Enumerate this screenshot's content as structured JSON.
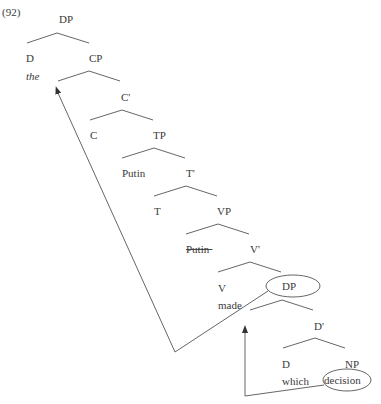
{
  "example_number": "(92)",
  "colors": {
    "line": "#555555",
    "text": "#3a3a3a",
    "background": "#ffffff"
  },
  "nodes": [
    {
      "id": "dp-root",
      "label": "DP",
      "x": 59,
      "y": 23
    },
    {
      "id": "d-top",
      "label": "D",
      "x": 26,
      "y": 62
    },
    {
      "id": "the",
      "label": "the",
      "x": 26,
      "y": 80,
      "style": "italic"
    },
    {
      "id": "cp",
      "label": "CP",
      "x": 89,
      "y": 62
    },
    {
      "id": "c-bar",
      "label": "C'",
      "x": 121,
      "y": 101
    },
    {
      "id": "c",
      "label": "C",
      "x": 90,
      "y": 139
    },
    {
      "id": "tp",
      "label": "TP",
      "x": 153,
      "y": 139
    },
    {
      "id": "putin-subject",
      "label": "Putin",
      "x": 122,
      "y": 177
    },
    {
      "id": "t-bar",
      "label": "T'",
      "x": 186,
      "y": 177
    },
    {
      "id": "t",
      "label": "T",
      "x": 154,
      "y": 215
    },
    {
      "id": "vp",
      "label": "VP",
      "x": 217,
      "y": 215
    },
    {
      "id": "putin-trace",
      "label": "Putin",
      "x": 186,
      "y": 253,
      "style": "strikethrough"
    },
    {
      "id": "v-bar",
      "label": "V'",
      "x": 250,
      "y": 253
    },
    {
      "id": "v",
      "label": "V",
      "x": 218,
      "y": 292
    },
    {
      "id": "made",
      "label": "made",
      "x": 218,
      "y": 309
    },
    {
      "id": "dp-object",
      "label": "DP",
      "x": 282,
      "y": 290,
      "circled": true
    },
    {
      "id": "d-bar",
      "label": "D'",
      "x": 314,
      "y": 330
    },
    {
      "id": "d-low",
      "label": "D",
      "x": 282,
      "y": 368
    },
    {
      "id": "which",
      "label": "which",
      "x": 282,
      "y": 385
    },
    {
      "id": "np",
      "label": "NP",
      "x": 345,
      "y": 368
    },
    {
      "id": "decision",
      "label": "decision",
      "x": 324,
      "y": 384,
      "circled": true
    }
  ],
  "branches": [
    {
      "apex": [
        57,
        33
      ],
      "left": [
        27,
        43
      ],
      "right": [
        89,
        43
      ]
    },
    {
      "apex": [
        89,
        71
      ],
      "left": [
        58,
        81
      ],
      "right": [
        120,
        81
      ]
    },
    {
      "apex": [
        122,
        110
      ],
      "left": [
        90,
        120
      ],
      "right": [
        153,
        120
      ]
    },
    {
      "apex": [
        154,
        148
      ],
      "left": [
        122,
        158
      ],
      "right": [
        185,
        158
      ]
    },
    {
      "apex": [
        186,
        186
      ],
      "left": [
        154,
        196
      ],
      "right": [
        217,
        196
      ]
    },
    {
      "apex": [
        218,
        224
      ],
      "left": [
        186,
        234
      ],
      "right": [
        249,
        234
      ]
    },
    {
      "apex": [
        250,
        262
      ],
      "left": [
        218,
        272
      ],
      "right": [
        281,
        272
      ]
    },
    {
      "apex": [
        282,
        300
      ],
      "left": [
        250,
        310
      ],
      "right": [
        313,
        310
      ]
    },
    {
      "apex": [
        315,
        338
      ],
      "left": [
        283,
        348
      ],
      "right": [
        345,
        348
      ]
    }
  ],
  "ellipses": [
    {
      "id": "dp-circle",
      "cx": 293,
      "cy": 286,
      "rx": 27,
      "ry": 11
    },
    {
      "id": "decision-circle",
      "cx": 347,
      "cy": 380,
      "rx": 24,
      "ry": 11
    }
  ],
  "movement_arrows": [
    {
      "id": "dp-to-spec-cp",
      "points": [
        [
          268,
          291
        ],
        [
          175,
          352
        ],
        [
          58,
          93
        ]
      ],
      "head": [
        57,
        90
      ],
      "head_dir": "up-left"
    },
    {
      "id": "decision-to-spec-dp",
      "points": [
        [
          324,
          385
        ],
        [
          245,
          396
        ],
        [
          245,
          333
        ]
      ],
      "head": [
        245,
        329
      ],
      "head_dir": "up"
    }
  ]
}
